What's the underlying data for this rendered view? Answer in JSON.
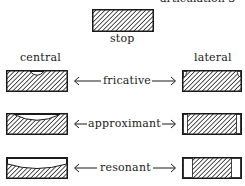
{
  "diagram": {
    "top_cut_text": "articulation 3",
    "stop": {
      "label": "stop"
    },
    "columns": {
      "left": "central",
      "right": "lateral"
    },
    "rows": [
      {
        "label": "fricative",
        "left_shape": "central-small-groove",
        "right_shape": "lateral-small-side-gaps"
      },
      {
        "label": "approximant",
        "left_shape": "central-wide-groove",
        "right_shape": "lateral-narrow-side-channels"
      },
      {
        "label": "resonant",
        "left_shape": "central-full-open-top",
        "right_shape": "lateral-wide-side-channels"
      }
    ],
    "colors": {
      "ink": "#1a1a1a",
      "background": "#ffffff"
    }
  }
}
